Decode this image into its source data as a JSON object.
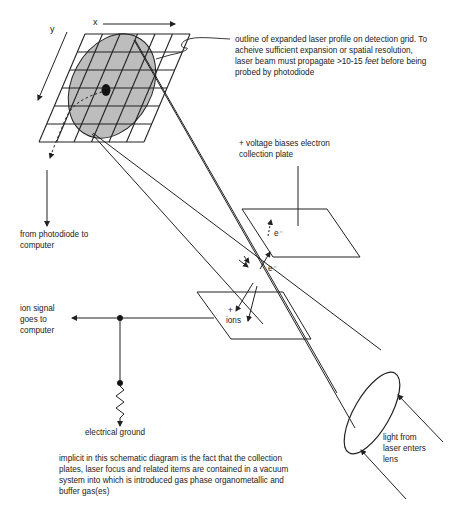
{
  "axes": {
    "x_label": "x",
    "y_label": "y"
  },
  "labels": {
    "laser_profile_outline": {
      "line1": "outline of expanded laser profile on detection grid. To",
      "line2": "acheive sufficient expansion or spatial resolution,",
      "line3_pre": "laser beam must propagate >10-15 ",
      "line3_italic": "feet",
      "line3_post": " before being",
      "line4": "probed by photodiode"
    },
    "voltage_bias": {
      "line1": "+ voltage biases electron",
      "line2": "collection plate"
    },
    "photodiode": {
      "line1": "from photodiode to",
      "line2": "computer"
    },
    "ion_signal": {
      "line1": "ion signal",
      "line2": "goes to",
      "line3": "computer"
    },
    "electron_top": "e⁻",
    "electron_bottom": "e⁻",
    "ions_plus": "+",
    "ions": "ions",
    "ground": "electrical ground",
    "laser_lens": {
      "line1": "light from",
      "line2": "laser enters",
      "line3": "lens"
    },
    "footnote": {
      "line1": "implicit in this schematic diagram is the fact that the collection",
      "line2": "plates, laser focus and related items are contained in a vacuum",
      "line3": "system into which is introduced gas phase organometallic and",
      "line4": "buffer gas(es)"
    }
  },
  "colors": {
    "line": "#222222",
    "profile_fill": "#bdbdbd",
    "background": "#ffffff"
  }
}
